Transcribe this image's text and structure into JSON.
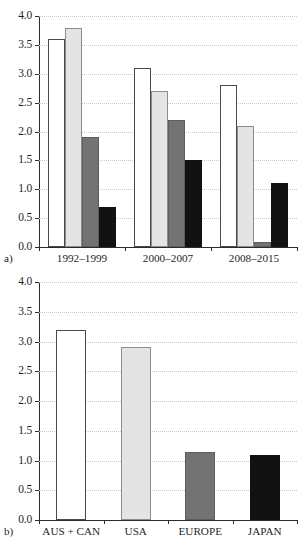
{
  "figure": {
    "panels": [
      {
        "id": "a",
        "panel_label": "a)",
        "yticks": [
          "0.0",
          "0.5",
          "1.0",
          "1.5",
          "2.0",
          "2.5",
          "3.0",
          "3.5",
          "4.0"
        ],
        "categories": [
          "1992–1999",
          "2000–2007",
          "2008–2015"
        ],
        "series_names": [
          "AUS + CAN",
          "USA",
          "EUROPE",
          "JAPAN"
        ],
        "series_colors": [
          "#ffffff",
          "#e4e4e4",
          "#737373",
          "#121212"
        ]
      },
      {
        "id": "b",
        "panel_label": "b)",
        "yticks": [
          "0.0",
          "0.5",
          "1.0",
          "1.5",
          "2.0",
          "2.5",
          "3.0",
          "3.5",
          "4.0"
        ],
        "categories": [
          "AUS + CAN",
          "USA",
          "EUROPE",
          "JAPAN"
        ],
        "series_colors": [
          "#ffffff",
          "#e4e4e4",
          "#737373",
          "#121212"
        ]
      }
    ]
  },
  "chart_data": [
    {
      "type": "bar",
      "panel": "a",
      "title": "",
      "xlabel": "",
      "ylabel": "",
      "ylim": [
        0.0,
        4.0
      ],
      "ytick_values": [
        0.0,
        0.5,
        1.0,
        1.5,
        2.0,
        2.5,
        3.0,
        3.5,
        4.0
      ],
      "grid": true,
      "legend": "none",
      "categories": [
        "1992–1999",
        "2000–2007",
        "2008–2015"
      ],
      "series": [
        {
          "name": "AUS + CAN",
          "color": "#ffffff",
          "values": [
            3.6,
            3.1,
            2.8
          ]
        },
        {
          "name": "USA",
          "color": "#e4e4e4",
          "values": [
            3.8,
            2.7,
            2.1
          ]
        },
        {
          "name": "EUROPE",
          "color": "#737373",
          "values": [
            1.9,
            2.2,
            0.08
          ]
        },
        {
          "name": "JAPAN",
          "color": "#121212",
          "values": [
            0.7,
            1.5,
            1.1
          ]
        }
      ]
    },
    {
      "type": "bar",
      "panel": "b",
      "title": "",
      "xlabel": "",
      "ylabel": "",
      "ylim": [
        0.0,
        4.0
      ],
      "ytick_values": [
        0.0,
        0.5,
        1.0,
        1.5,
        2.0,
        2.5,
        3.0,
        3.5,
        4.0
      ],
      "grid": true,
      "legend": "none",
      "categories": [
        "AUS + CAN",
        "USA",
        "EUROPE",
        "JAPAN"
      ],
      "values": [
        3.2,
        2.9,
        1.15,
        1.1
      ],
      "colors": [
        "#ffffff",
        "#e4e4e4",
        "#737373",
        "#121212"
      ]
    }
  ]
}
